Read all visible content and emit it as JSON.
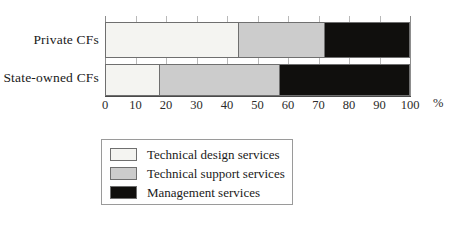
{
  "chart_data": {
    "type": "bar",
    "orientation": "horizontal",
    "stacked": true,
    "title": "",
    "xlabel": "%",
    "ylabel": "",
    "xlim": [
      0,
      100
    ],
    "xticks": [
      0,
      10,
      20,
      30,
      40,
      50,
      60,
      70,
      80,
      90,
      100
    ],
    "xtick_labels": [
      "0",
      "10",
      "20",
      "30",
      "40",
      "50",
      "60",
      "70",
      "80",
      "90",
      "100"
    ],
    "grid": true,
    "grid_axis": "x",
    "legend_position": "below-left",
    "categories": [
      "Private CFs",
      "State-owned CFs"
    ],
    "series": [
      {
        "name": "Technical design services",
        "color": "#f4f4f1",
        "values": [
          43.5,
          17.5
        ]
      },
      {
        "name": "Technical support services",
        "color": "#cccccc",
        "values": [
          28.5,
          39.5
        ]
      },
      {
        "name": "Management services",
        "color": "#100f0d",
        "values": [
          28.0,
          43.0
        ]
      }
    ],
    "cumulative_boundaries": [
      [
        43.5,
        72.0,
        100.0
      ],
      [
        17.5,
        57.0,
        100.0
      ]
    ]
  },
  "axis": {
    "unit_label": "%"
  },
  "legend": {
    "items": [
      {
        "label": "Technical design services",
        "swatch": "design"
      },
      {
        "label": "Technical support services",
        "swatch": "support"
      },
      {
        "label": "Management services",
        "swatch": "management"
      }
    ]
  }
}
